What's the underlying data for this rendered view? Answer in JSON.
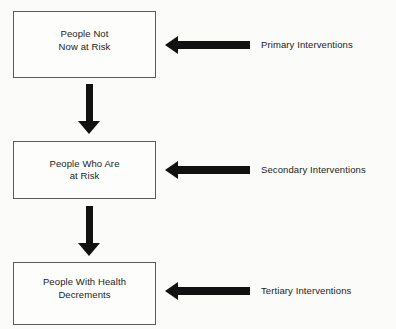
{
  "diagram": {
    "type": "flowchart",
    "orientation": "vertical-with-side-inputs",
    "background_color": "#fbfbf9",
    "line_color": "#5a5a5a",
    "arrow_color": "#111111",
    "text_color": "#1c1c1c",
    "nodes": [
      {
        "id": "node-1",
        "label": "People Not\nNow at Risk"
      },
      {
        "id": "node-2",
        "label": "People Who Are\nat Risk"
      },
      {
        "id": "node-3",
        "label": "People With Health\nDecrements"
      }
    ],
    "flow_arrows": [
      {
        "id": "flow-1",
        "direction": "down",
        "from": "node-1",
        "to": "node-2"
      },
      {
        "id": "flow-2",
        "direction": "down",
        "from": "node-2",
        "to": "node-3"
      }
    ],
    "intervention_arrows": [
      {
        "id": "intervention-1",
        "direction": "left",
        "target": "node-1"
      },
      {
        "id": "intervention-2",
        "direction": "left",
        "target": "node-2"
      },
      {
        "id": "intervention-3",
        "direction": "left",
        "target": "node-3"
      }
    ],
    "intervention_labels": [
      {
        "id": "label-1",
        "text": "Primary Interventions"
      },
      {
        "id": "label-2",
        "text": "Secondary Interventions"
      },
      {
        "id": "label-3",
        "text": "Tertiary Interventions"
      }
    ]
  }
}
